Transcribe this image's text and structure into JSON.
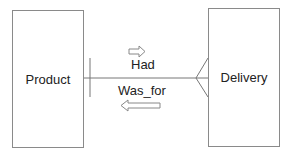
{
  "diagram": {
    "type": "entity-relationship",
    "entities": [
      {
        "id": "product",
        "label": "Product"
      },
      {
        "id": "delivery",
        "label": "Delivery"
      }
    ],
    "relationship": {
      "forward_label": "Had",
      "reverse_label": "Was_for",
      "from": "Product",
      "to": "Delivery",
      "from_cardinality": "one",
      "to_cardinality": "many"
    }
  }
}
